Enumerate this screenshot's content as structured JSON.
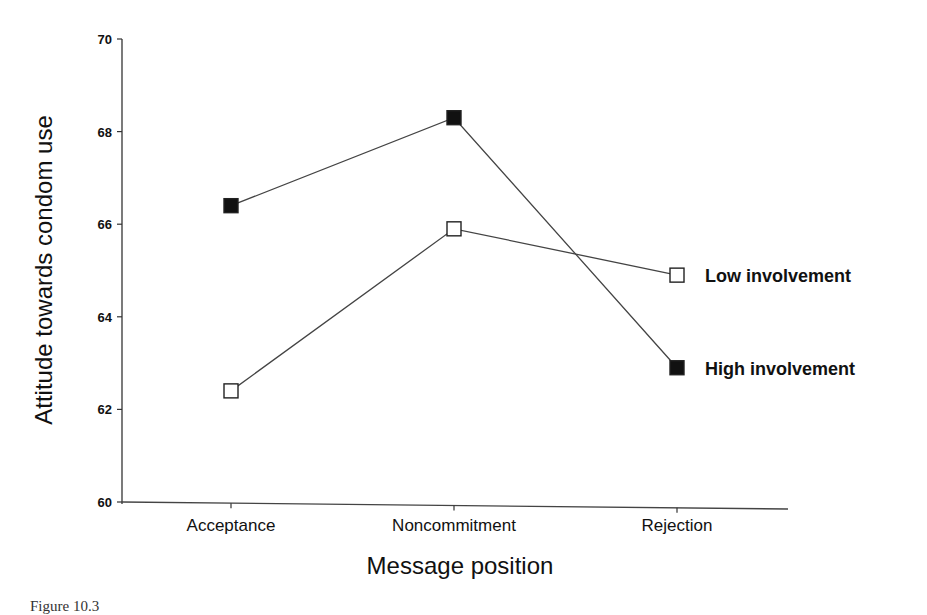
{
  "chart_data": {
    "type": "line",
    "title": "",
    "xlabel": "Message position",
    "ylabel": "Attitude towards condom use",
    "categories": [
      "Acceptance",
      "Noncommitment",
      "Rejection"
    ],
    "ylim": [
      60,
      70
    ],
    "yticks": [
      60,
      62,
      64,
      66,
      68,
      70
    ],
    "grid": false,
    "legend_position": "inline-right",
    "series": [
      {
        "name": "Low involvement",
        "marker": "open-square",
        "values": [
          62.4,
          65.9,
          64.9
        ]
      },
      {
        "name": "High involvement",
        "marker": "filled-square",
        "values": [
          66.4,
          68.3,
          62.9
        ]
      }
    ]
  },
  "caption": "Figure 10.3"
}
